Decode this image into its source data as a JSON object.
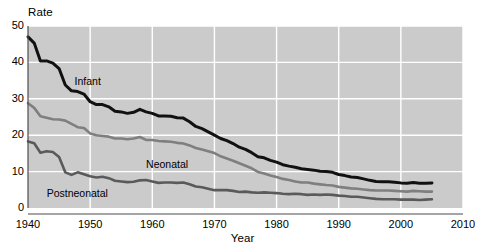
{
  "chart_data": {
    "type": "line",
    "title": "",
    "xlabel": "Year",
    "ylabel": "Rate",
    "xlim": [
      1940,
      2010
    ],
    "ylim": [
      0,
      50
    ],
    "grid": true,
    "legend_position": "inline-annotations",
    "xticks": [
      1940,
      1950,
      1960,
      1970,
      1980,
      1990,
      2000,
      2010
    ],
    "xtick_labels": [
      "1940",
      "1950",
      "1960",
      "1970",
      "1980",
      "1990",
      "2000",
      "2010"
    ],
    "yticks": [
      0,
      10,
      20,
      30,
      40,
      50
    ],
    "ytick_labels": [
      "0",
      "10",
      "20",
      "30",
      "40",
      "50"
    ],
    "x": [
      1940,
      1941,
      1942,
      1943,
      1944,
      1945,
      1946,
      1947,
      1948,
      1949,
      1950,
      1951,
      1952,
      1953,
      1954,
      1955,
      1956,
      1957,
      1958,
      1959,
      1960,
      1961,
      1962,
      1963,
      1964,
      1965,
      1966,
      1967,
      1968,
      1969,
      1970,
      1971,
      1972,
      1973,
      1974,
      1975,
      1976,
      1977,
      1978,
      1979,
      1980,
      1981,
      1982,
      1983,
      1984,
      1985,
      1986,
      1987,
      1988,
      1989,
      1990,
      1991,
      1992,
      1993,
      1994,
      1995,
      1996,
      1997,
      1998,
      1999,
      2000,
      2001,
      2002,
      2003,
      2004,
      2005
    ],
    "series": [
      {
        "name": "Infant",
        "color": "#111111",
        "label_x": 1947.5,
        "label_y": 34.5,
        "values": [
          47.0,
          45.3,
          40.4,
          40.4,
          39.8,
          38.3,
          33.8,
          32.2,
          32.0,
          31.3,
          29.2,
          28.4,
          28.4,
          27.8,
          26.6,
          26.4,
          26.0,
          26.3,
          27.1,
          26.4,
          26.0,
          25.3,
          25.3,
          25.2,
          24.8,
          24.7,
          23.7,
          22.4,
          21.8,
          20.9,
          20.0,
          19.1,
          18.5,
          17.7,
          16.7,
          16.1,
          15.2,
          14.1,
          13.8,
          13.1,
          12.6,
          11.9,
          11.5,
          11.2,
          10.8,
          10.6,
          10.4,
          10.1,
          10.0,
          9.8,
          9.2,
          8.9,
          8.5,
          8.4,
          8.0,
          7.6,
          7.3,
          7.2,
          7.2,
          7.1,
          6.9,
          6.8,
          7.0,
          6.8,
          6.8,
          6.9
        ]
      },
      {
        "name": "Neonatal",
        "color": "#7f7f7f",
        "label_x": 1959.0,
        "label_y": 11.8,
        "values": [
          28.8,
          27.5,
          25.2,
          24.8,
          24.4,
          24.3,
          24.0,
          23.1,
          22.2,
          22.0,
          20.5,
          20.0,
          19.8,
          19.6,
          19.1,
          19.1,
          18.9,
          19.1,
          19.5,
          18.7,
          18.7,
          18.4,
          18.3,
          18.2,
          17.9,
          17.7,
          17.2,
          16.5,
          16.1,
          15.6,
          15.1,
          14.2,
          13.6,
          13.0,
          12.3,
          11.6,
          10.9,
          9.9,
          9.5,
          8.9,
          8.5,
          8.0,
          7.7,
          7.3,
          7.0,
          7.0,
          6.7,
          6.5,
          6.3,
          6.2,
          5.8,
          5.6,
          5.4,
          5.3,
          5.1,
          4.9,
          4.8,
          4.8,
          4.8,
          4.7,
          4.6,
          4.5,
          4.7,
          4.6,
          4.5,
          4.5
        ]
      },
      {
        "name": "Postneonatal",
        "color": "#5a5a5a",
        "label_x": 1943.0,
        "label_y": 3.9,
        "values": [
          18.3,
          17.8,
          15.2,
          15.6,
          15.4,
          14.0,
          9.8,
          9.1,
          9.8,
          9.3,
          8.7,
          8.4,
          8.6,
          8.2,
          7.5,
          7.3,
          7.1,
          7.2,
          7.6,
          7.7,
          7.3,
          6.9,
          7.0,
          7.0,
          6.9,
          7.0,
          6.5,
          5.9,
          5.7,
          5.3,
          4.9,
          4.9,
          4.9,
          4.7,
          4.4,
          4.5,
          4.3,
          4.2,
          4.3,
          4.2,
          4.1,
          3.9,
          3.8,
          3.9,
          3.8,
          3.6,
          3.7,
          3.6,
          3.7,
          3.6,
          3.4,
          3.3,
          3.1,
          3.1,
          2.9,
          2.7,
          2.5,
          2.4,
          2.4,
          2.4,
          2.3,
          2.3,
          2.3,
          2.2,
          2.3,
          2.4
        ]
      }
    ],
    "plot_background": "#cbcbcb",
    "gridline_color": "#ffffff",
    "axis_color": "#4d4d4d"
  }
}
